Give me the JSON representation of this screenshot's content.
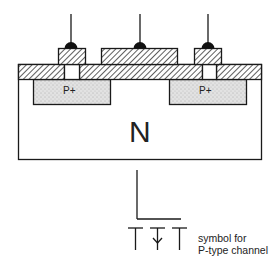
{
  "diagram": {
    "substrate_label": "N",
    "source_label": "P+",
    "drain_label": "P+",
    "caption_line1": "symbol for",
    "caption_line2": "P-type channel"
  },
  "colors": {
    "line": "#1a1a1a",
    "background": "#ffffff",
    "stipple": "#d6d6d6"
  }
}
